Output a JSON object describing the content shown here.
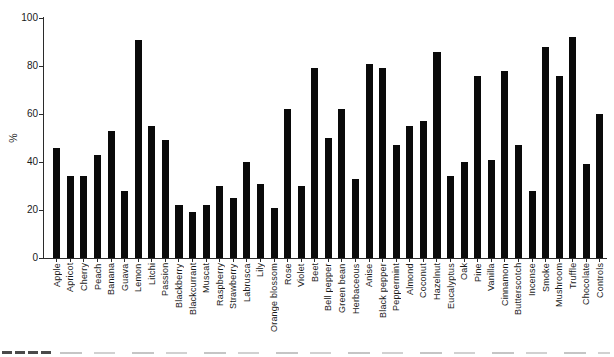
{
  "chart_data": {
    "type": "bar",
    "title": "",
    "xlabel": "",
    "ylabel": "%",
    "ylim": [
      0,
      100
    ],
    "yticks": [
      0,
      20,
      40,
      60,
      80,
      100
    ],
    "grid": false,
    "legend": null,
    "bar_color": "#0a0a0a",
    "axis_color": "#2b2b2b",
    "background_color": "#ffffff",
    "categories": [
      "Apple",
      "Apricot",
      "Cherry",
      "Peach",
      "Banana",
      "Guava",
      "Lemon",
      "Litchi",
      "Passion",
      "Blackberry",
      "Blackcurrant",
      "Muscat",
      "Raspberry",
      "Strawberry",
      "Labrusca",
      "Lily",
      "Orange blossom",
      "Rose",
      "Violet",
      "Beet",
      "Bell pepper",
      "Green bean",
      "Herbaceous",
      "Anise",
      "Black pepper",
      "Peppermint",
      "Almond",
      "Coconut",
      "Hazelnut",
      "Eucalyptus",
      "Oak",
      "Pine",
      "Vanilla",
      "Cinnamon",
      "Butterscotch",
      "Incense",
      "Smoke",
      "Mushroom",
      "Truffle",
      "Chocolate",
      "Controls"
    ],
    "values": [
      46,
      34,
      34,
      43,
      53,
      28,
      91,
      55,
      49,
      22,
      19,
      22,
      30,
      25,
      40,
      31,
      21,
      62,
      30,
      79,
      50,
      62,
      33,
      81,
      79,
      47,
      55,
      57,
      86,
      34,
      40,
      76,
      41,
      78,
      47,
      28,
      88,
      76,
      92,
      39,
      60
    ]
  }
}
